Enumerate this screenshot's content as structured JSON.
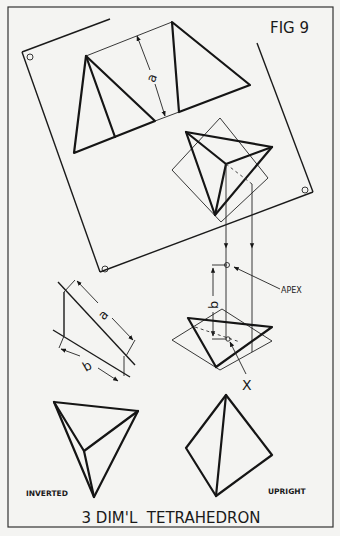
{
  "figure": {
    "label": "FIG 9",
    "title": "3 DIM'L  TETRAHEDRON",
    "background": "#f4f4f2",
    "ink": "#151515"
  },
  "dimensions": {
    "a_label": "a",
    "b_label": "b"
  },
  "annotations": {
    "apex": "APEX",
    "x_point": "X"
  },
  "views": {
    "inverted": "INVERTED",
    "upright": "UPRIGHT"
  }
}
